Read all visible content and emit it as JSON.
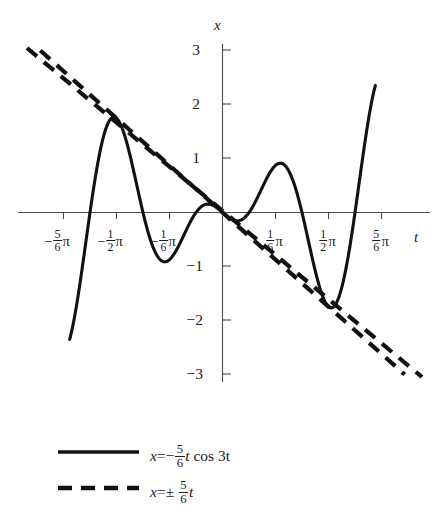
{
  "figure": {
    "title": "",
    "background_color": "#ffffff",
    "curve_color": "#111111",
    "axis_color": "#4c4c4c"
  },
  "axes": {
    "x_axis_label": "t",
    "y_axis_label": "x",
    "x_tick_labels": [
      {
        "id": "neg-5-6-pi",
        "sign": "−",
        "num": "5",
        "den": "6",
        "unit": "π",
        "value": -2.618
      },
      {
        "id": "neg-1-2-pi",
        "sign": "−",
        "num": "1",
        "den": "2",
        "unit": "π",
        "value": -1.5708
      },
      {
        "id": "neg-1-6-pi",
        "sign": "−",
        "num": "1",
        "den": "6",
        "unit": "π",
        "value": -0.5236
      },
      {
        "id": "pos-1-6-pi",
        "sign": "",
        "num": "1",
        "den": "6",
        "unit": "π",
        "value": 0.5236
      },
      {
        "id": "pos-1-2-pi",
        "sign": "",
        "num": "1",
        "den": "2",
        "unit": "π",
        "value": 1.5708
      },
      {
        "id": "pos-5-6-pi",
        "sign": "",
        "num": "5",
        "den": "6",
        "unit": "π",
        "value": 2.618
      }
    ],
    "y_tick_labels": [
      "3",
      "2",
      "1",
      "−1",
      "−2",
      "−3"
    ],
    "y_tick_values": [
      3,
      2,
      1,
      -1,
      -2,
      -3
    ],
    "xlim": [
      -3.0,
      3.3
    ],
    "ylim": [
      -3.2,
      3.2
    ],
    "grid": "off"
  },
  "legend": {
    "position": "below-plot",
    "entries": [
      {
        "id": "solid-curve",
        "style": "solid",
        "lhs": "x",
        "eq": "=",
        "sign": "−",
        "num": "5",
        "den": "6",
        "var": "t",
        "rest": "cos 3t",
        "formula": "x = −(5/6) t cos 3t"
      },
      {
        "id": "dashed-envelope",
        "style": "dashed",
        "lhs": "x",
        "eq": "=",
        "sign": "±",
        "num": "5",
        "den": "6",
        "var": "t",
        "rest": "",
        "formula": "x = ±(5/6) t"
      }
    ]
  },
  "chart_data": {
    "type": "line",
    "title": "",
    "xlabel": "t",
    "ylabel": "x",
    "xlim": [
      -3.0,
      3.3
    ],
    "ylim": [
      -3.2,
      3.2
    ],
    "grid": "off",
    "legend_position": "below",
    "xticks": [
      -2.618,
      -1.5708,
      -0.5236,
      0.5236,
      1.5708,
      2.618
    ],
    "xticklabels": [
      "−5π/6",
      "−π/2",
      "−π/6",
      "π/6",
      "π/2",
      "5π/6"
    ],
    "yticks": [
      -3,
      -2,
      -1,
      1,
      2,
      3
    ],
    "yticklabels": [
      "−3",
      "−2",
      "−1",
      "1",
      "2",
      "3"
    ],
    "series": [
      {
        "name": "x = −(5/6) t cos 3t",
        "style": "solid",
        "color": "#111111",
        "function": "x(t) = -(5/6) * t * cos(3t)",
        "t_range": [
          -3.02,
          3.02
        ],
        "key_points": [
          {
            "t": -3.02,
            "x": -1.74
          },
          {
            "t": -2.8,
            "x": -2.53
          },
          {
            "t": -2.618,
            "x": -2.618
          },
          {
            "t": -2.3,
            "x": -1.33
          },
          {
            "t": -2.094,
            "x": 0.0
          },
          {
            "t": -1.8,
            "x": 1.4
          },
          {
            "t": -1.745,
            "x": 1.454
          },
          {
            "t": -1.5708,
            "x": 1.309
          },
          {
            "t": -1.3,
            "x": 0.48
          },
          {
            "t": -1.047,
            "x": 0.0
          },
          {
            "t": -0.9,
            "x": -0.53
          },
          {
            "t": -0.873,
            "x": -0.727
          },
          {
            "t": -0.7,
            "x": -0.84
          },
          {
            "t": -0.5236,
            "x": -0.436
          },
          {
            "t": -0.35,
            "x": -0.12
          },
          {
            "t": 0.0,
            "x": 0.0
          },
          {
            "t": 0.35,
            "x": 0.12
          },
          {
            "t": 0.5236,
            "x": 0.436
          },
          {
            "t": 0.7,
            "x": 0.84
          },
          {
            "t": 0.873,
            "x": 0.727
          },
          {
            "t": 1.047,
            "x": 0.0
          },
          {
            "t": 1.3,
            "x": -0.48
          },
          {
            "t": 1.5708,
            "x": -1.309
          },
          {
            "t": 1.745,
            "x": -1.454
          },
          {
            "t": 2.094,
            "x": 0.0
          },
          {
            "t": 2.618,
            "x": 2.618
          },
          {
            "t": 2.8,
            "x": 2.53
          },
          {
            "t": 3.02,
            "x": 1.74
          }
        ]
      },
      {
        "name": "x = +(5/6) t",
        "style": "dashed",
        "color": "#111111",
        "function": "x(t) = (5/6) t",
        "t_range": [
          -3.6,
          3.6
        ],
        "endpoints": [
          {
            "t": -3.6,
            "x": -3.0
          },
          {
            "t": 3.6,
            "x": 3.0
          }
        ]
      },
      {
        "name": "x = −(5/6) t",
        "style": "dashed",
        "color": "#111111",
        "function": "x(t) = -(5/6) t",
        "t_range": [
          -3.6,
          3.6
        ],
        "endpoints": [
          {
            "t": -3.6,
            "x": 3.0
          },
          {
            "t": 3.6,
            "x": -3.0
          }
        ]
      }
    ]
  }
}
